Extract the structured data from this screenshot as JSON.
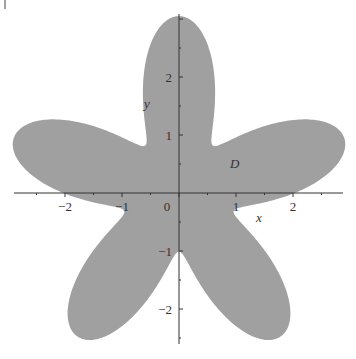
{
  "chart_data": {
    "type": "area",
    "title": "",
    "xlabel": "x",
    "ylabel": "y",
    "region_label": "D",
    "x_ticks": [
      "-2",
      "-1",
      "0",
      "1",
      "2"
    ],
    "y_ticks": [
      "-2",
      "-1",
      "1",
      "2"
    ],
    "xlim": [
      -3.1,
      3.0
    ],
    "ylim": [
      -2.8,
      3.2
    ],
    "grid": false,
    "legend": null,
    "curve": {
      "a": 2.03,
      "b": 1.02,
      "petals": 5,
      "phase_deg": 90
    },
    "fill_color": "#a0a0a0",
    "axis_color": "#333333"
  }
}
